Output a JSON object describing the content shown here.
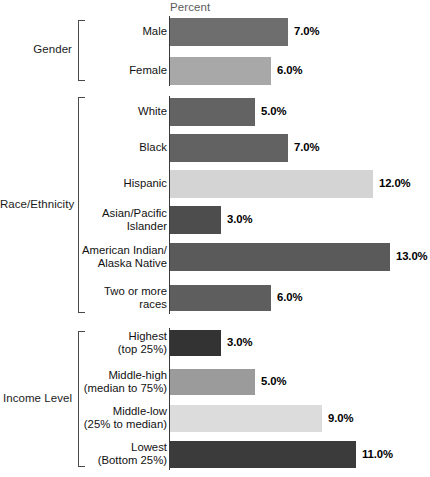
{
  "axis": {
    "title": "Percent"
  },
  "groups": [
    {
      "id": "gender",
      "label": "Gender"
    },
    {
      "id": "race-ethnicity",
      "label": "Race/Ethnicity"
    },
    {
      "id": "income-level",
      "label": "Income Level"
    }
  ],
  "bars": [
    {
      "group": "gender",
      "label_line1": "Male",
      "label_line2": "",
      "value": 7.0,
      "value_text": "7.0%",
      "color": "#6e6e6e"
    },
    {
      "group": "gender",
      "label_line1": "Female",
      "label_line2": "",
      "value": 6.0,
      "value_text": "6.0%",
      "color": "#a8a8a8"
    },
    {
      "group": "race-ethnicity",
      "label_line1": "White",
      "label_line2": "",
      "value": 5.0,
      "value_text": "5.0%",
      "color": "#636363"
    },
    {
      "group": "race-ethnicity",
      "label_line1": "Black",
      "label_line2": "",
      "value": 7.0,
      "value_text": "7.0%",
      "color": "#626262"
    },
    {
      "group": "race-ethnicity",
      "label_line1": "Hispanic",
      "label_line2": "",
      "value": 12.0,
      "value_text": "12.0%",
      "color": "#d4d4d4"
    },
    {
      "group": "race-ethnicity",
      "label_line1": "Asian/Pacific",
      "label_line2": "Islander",
      "value": 3.0,
      "value_text": "3.0%",
      "color": "#4d4d4d"
    },
    {
      "group": "race-ethnicity",
      "label_line1": "American Indian/",
      "label_line2": "Alaska Native",
      "value": 13.0,
      "value_text": "13.0%",
      "color": "#5a5a5a"
    },
    {
      "group": "race-ethnicity",
      "label_line1": "Two or more",
      "label_line2": "races",
      "value": 6.0,
      "value_text": "6.0%",
      "color": "#5e5e5e"
    },
    {
      "group": "income-level",
      "label_line1": "Highest",
      "label_line2": "(top 25%)",
      "value": 3.0,
      "value_text": "3.0%",
      "color": "#333333"
    },
    {
      "group": "income-level",
      "label_line1": "Middle-high",
      "label_line2": "(median to 75%)",
      "value": 5.0,
      "value_text": "5.0%",
      "color": "#9b9b9b"
    },
    {
      "group": "income-level",
      "label_line1": "Middle-low",
      "label_line2": "(25% to median)",
      "value": 9.0,
      "value_text": "9.0%",
      "color": "#dcdcdc"
    },
    {
      "group": "income-level",
      "label_line1": "Lowest",
      "label_line2": "(Bottom 25%)",
      "value": 11.0,
      "value_text": "11.0%",
      "color": "#3b3b3b"
    }
  ],
  "chart_data": {
    "type": "bar",
    "orientation": "horizontal",
    "title": "",
    "xlabel": "Percent",
    "ylabel": "",
    "xlim": [
      0,
      13
    ],
    "grid": false,
    "legend": null,
    "value_label_format": "0.0%",
    "group_labels": [
      "Gender",
      "Race/Ethnicity",
      "Income Level"
    ],
    "categories": [
      "Male",
      "Female",
      "White",
      "Black",
      "Hispanic",
      "Asian/Pacific Islander",
      "American Indian/Alaska Native",
      "Two or more races",
      "Highest (top 25%)",
      "Middle-high (median to 75%)",
      "Middle-low (25% to median)",
      "Lowest (Bottom 25%)"
    ],
    "values": [
      7.0,
      6.0,
      5.0,
      7.0,
      12.0,
      3.0,
      13.0,
      6.0,
      3.0,
      5.0,
      9.0,
      11.0
    ],
    "data_labels": [
      "7.0%",
      "6.0%",
      "5.0%",
      "7.0%",
      "12.0%",
      "3.0%",
      "13.0%",
      "6.0%",
      "3.0%",
      "5.0%",
      "9.0%",
      "11.0%"
    ],
    "groups": {
      "Gender": [
        "Male",
        "Female"
      ],
      "Race/Ethnicity": [
        "White",
        "Black",
        "Hispanic",
        "Asian/Pacific Islander",
        "American Indian/Alaska Native",
        "Two or more races"
      ],
      "Income Level": [
        "Highest (top 25%)",
        "Middle-high (median to 75%)",
        "Middle-low (25% to median)",
        "Lowest (Bottom 25%)"
      ]
    }
  },
  "layout": {
    "axis_x": 170,
    "px_per_percent": 16.9,
    "rows": [
      {
        "top": 18,
        "height": 28,
        "label_top": 25,
        "two_line": false
      },
      {
        "top": 57,
        "height": 28,
        "label_top": 64,
        "two_line": false
      },
      {
        "top": 98,
        "height": 28,
        "label_top": 105,
        "two_line": false
      },
      {
        "top": 134,
        "height": 28,
        "label_top": 141,
        "two_line": false
      },
      {
        "top": 170,
        "height": 28,
        "label_top": 177,
        "two_line": false
      },
      {
        "top": 206,
        "height": 28,
        "label_top": 206,
        "two_line": true
      },
      {
        "top": 243,
        "height": 28,
        "label_top": 243,
        "two_line": true
      },
      {
        "top": 285,
        "height": 26,
        "label_top": 284,
        "two_line": true
      },
      {
        "top": 330,
        "height": 26,
        "label_top": 329,
        "two_line": true
      },
      {
        "top": 369,
        "height": 26,
        "label_top": 368,
        "two_line": true
      },
      {
        "top": 405,
        "height": 27,
        "label_top": 404,
        "two_line": true
      },
      {
        "top": 441,
        "height": 27,
        "label_top": 440,
        "two_line": true
      }
    ],
    "brackets": [
      {
        "group": "gender",
        "top": 20,
        "height": 61,
        "left": 78,
        "label_top": 43,
        "label_left": 0,
        "label_width": 72
      },
      {
        "group": "race-ethnicity",
        "top": 97,
        "height": 216,
        "left": 78,
        "label_top": 198,
        "label_left": 0,
        "label_width": 72
      },
      {
        "group": "income-level",
        "top": 331,
        "height": 136,
        "left": 78,
        "label_top": 392,
        "label_left": 0,
        "label_width": 72
      }
    ],
    "axis_segments": [
      {
        "top": 16,
        "height": 70
      },
      {
        "top": 96,
        "height": 218
      },
      {
        "top": 328,
        "height": 142
      }
    ]
  }
}
